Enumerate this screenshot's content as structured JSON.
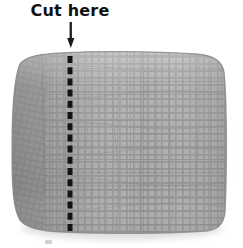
{
  "illustration": {
    "subject": "woven fabric swatch",
    "label": {
      "text": "Cut here",
      "color": "#111111"
    },
    "arrow": {
      "name": "down-arrow",
      "direction": "down",
      "color": "#1a1a1a"
    },
    "cut_line": {
      "style": "dashed",
      "orientation": "vertical",
      "color": "#141414",
      "dash_count": 17
    },
    "fabric": {
      "material": "mesh weave",
      "base_color": "#9a9a9a",
      "thread_color": "#888888",
      "cell_color": "#a9a9a9",
      "highlight_color": "#b5b5b5",
      "shadow_color": "#7e7e7e",
      "edge_color": "#8a8a8a",
      "background": "#ffffff"
    }
  }
}
